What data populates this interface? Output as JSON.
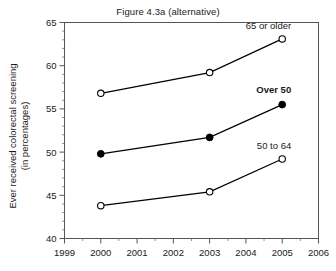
{
  "chart_data": {
    "type": "line",
    "title": "Figure 4.3a (alternative)",
    "xlabel": "",
    "ylabel": "Ever received colorectal screening (in percentages)",
    "ylabel_line1": "Ever received colorectal screening",
    "ylabel_line2": "(in percentages)",
    "x": [
      2000,
      2003,
      2005
    ],
    "xlim": [
      1999,
      2006
    ],
    "ylim": [
      40,
      65
    ],
    "xticks": [
      1999,
      2000,
      2001,
      2002,
      2003,
      2004,
      2005,
      2006
    ],
    "xtick_labels": [
      "1999",
      "2000",
      "2001",
      "2002",
      "2003",
      "2004",
      "2005",
      "2006"
    ],
    "yticks": [
      40,
      45,
      50,
      55,
      60,
      65
    ],
    "ytick_labels": [
      "40",
      "45",
      "50",
      "55",
      "60",
      "65"
    ],
    "y_minor_step": 1,
    "grid": false,
    "legend_position": "inline-annotations",
    "series": [
      {
        "name": "65 or older",
        "label": "65 or older",
        "marker": "open-circle",
        "bold": false,
        "color": "#000000",
        "values": [
          56.8,
          59.2,
          63.1
        ]
      },
      {
        "name": "Over 50",
        "label": "Over 50",
        "marker": "filled-circle",
        "bold": true,
        "color": "#000000",
        "values": [
          49.8,
          51.7,
          55.5
        ]
      },
      {
        "name": "50 to 64",
        "label": "50 to 64",
        "marker": "open-circle",
        "bold": false,
        "color": "#000000",
        "values": [
          43.8,
          45.4,
          49.2
        ]
      }
    ],
    "annotations": [
      {
        "text": "65 or older",
        "x": 2005,
        "y": 64.2,
        "bold": false
      },
      {
        "text": "Over 50",
        "x": 2005,
        "y": 56.8,
        "bold": true
      },
      {
        "text": "50 to 64",
        "x": 2005,
        "y": 50.4,
        "bold": false
      }
    ]
  }
}
